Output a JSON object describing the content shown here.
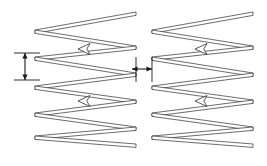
{
  "figure": {
    "background_color": "#ffffff",
    "line_color": "#2e2e2e",
    "dimension_color": "#1a1a1a",
    "width": 267,
    "height": 166
  },
  "chart_data": {
    "type": "diagram",
    "title": "",
    "xlabel": "",
    "ylabel": "",
    "blocks": [
      {
        "name": "left-zigzag-block",
        "x_left": 35,
        "x_right": 136,
        "y_top": 12,
        "y_bottom": 144,
        "pass_count": 11,
        "vertices": [
          [
            136,
            12
          ],
          [
            35,
            30
          ],
          [
            136,
            46
          ],
          [
            35,
            57
          ],
          [
            136,
            73
          ],
          [
            35,
            86
          ],
          [
            136,
            100
          ],
          [
            35,
            113
          ],
          [
            136,
            127
          ],
          [
            35,
            136
          ],
          [
            136,
            144
          ]
        ]
      },
      {
        "name": "right-zigzag-block",
        "x_left": 152,
        "x_right": 253,
        "y_top": 12,
        "y_bottom": 144,
        "pass_count": 11,
        "vertices": [
          [
            253,
            12
          ],
          [
            152,
            30
          ],
          [
            253,
            46
          ],
          [
            152,
            57
          ],
          [
            253,
            73
          ],
          [
            152,
            86
          ],
          [
            253,
            100
          ],
          [
            152,
            113
          ],
          [
            253,
            127
          ],
          [
            152,
            136
          ],
          [
            253,
            144
          ]
        ]
      }
    ],
    "flow_arrows": [
      {
        "name": "left-block-upper-flow-arrow",
        "x": 84,
        "y": 49,
        "direction": "left"
      },
      {
        "name": "left-block-lower-flow-arrow",
        "x": 84,
        "y": 101,
        "direction": "left"
      },
      {
        "name": "right-block-upper-flow-arrow",
        "x": 201,
        "y": 49,
        "direction": "left"
      },
      {
        "name": "right-block-lower-flow-arrow",
        "x": 201,
        "y": 101,
        "direction": "left"
      }
    ],
    "dimensions": [
      {
        "name": "hatch-spacing-dimension",
        "orientation": "vertical",
        "x": 25,
        "y_start": 53,
        "y_end": 80,
        "label": "",
        "extension_lines": [
          {
            "y": 53,
            "x_start": 14,
            "x_end": 40
          },
          {
            "y": 80,
            "x_start": 14,
            "x_end": 40
          }
        ]
      },
      {
        "name": "block-gap-dimension",
        "orientation": "horizontal",
        "y": 69,
        "x_start": 132,
        "x_end": 152,
        "label": "",
        "extension_lines": [
          {
            "x": 136,
            "y_start": 57,
            "y_end": 82
          },
          {
            "x": 152,
            "y_start": 57,
            "y_end": 82
          }
        ]
      }
    ],
    "legend": [],
    "annotations": []
  }
}
